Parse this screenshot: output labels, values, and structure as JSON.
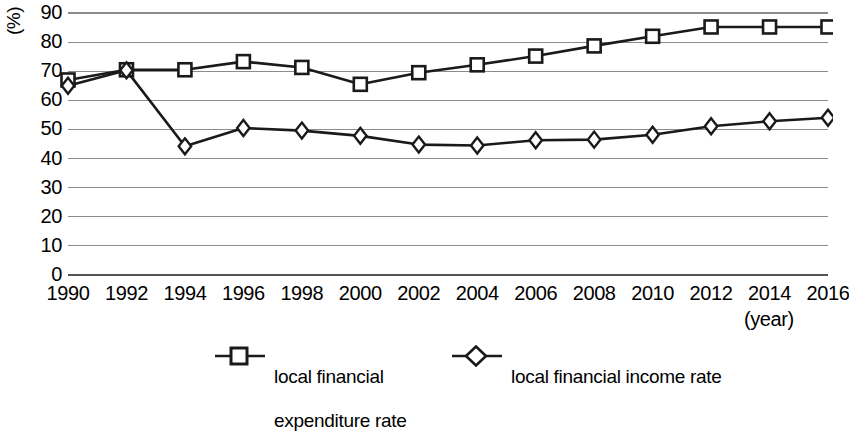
{
  "chart_data": {
    "type": "line",
    "title": "",
    "subtitle": "",
    "xlabel": "(year)",
    "ylabel": "(%)",
    "x": [
      1990,
      1992,
      1994,
      1996,
      1998,
      2000,
      2002,
      2004,
      2006,
      2008,
      2010,
      2012,
      2014,
      2016
    ],
    "categories": [
      "1990",
      "1992",
      "1994",
      "1996",
      "1998",
      "2000",
      "2002",
      "2004",
      "2006",
      "2008",
      "2010",
      "2012",
      "2014",
      "2016"
    ],
    "xlim": [
      1990,
      2016
    ],
    "ylim": [
      0,
      90
    ],
    "y_ticks": [
      0,
      10,
      20,
      30,
      40,
      50,
      60,
      70,
      80,
      90
    ],
    "y_tick_labels": [
      "0",
      "10",
      "20",
      "30",
      "40",
      "50",
      "60",
      "70",
      "80",
      "90"
    ],
    "grid": true,
    "grid_axis": "y",
    "legend_position": "bottom",
    "series": [
      {
        "name": "local financial expenditure rate",
        "name_lines": [
          "local financial",
          "expenditure rate"
        ],
        "marker": "square",
        "color": "#1a1a1a",
        "values": [
          67,
          70.5,
          70.5,
          73.3,
          71.3,
          65.5,
          69.5,
          72.2,
          75.2,
          78.7,
          82,
          85.2,
          85.2,
          85.2
        ]
      },
      {
        "name": "local financial income rate",
        "name_lines": [
          "local financial income rate"
        ],
        "marker": "diamond",
        "color": "#1a1a1a",
        "values": [
          65,
          70.3,
          44.2,
          50.5,
          49.6,
          47.8,
          44.8,
          44.5,
          46.3,
          46.5,
          48.2,
          51.1,
          52.8,
          54
        ]
      }
    ]
  },
  "axes": {
    "y_unit": "(%)",
    "x_unit": "(year)"
  },
  "legend": {
    "items": [
      {
        "marker": "square-marker-icon",
        "label_line1": "local financial",
        "label_line2": "expenditure rate"
      },
      {
        "marker": "diamond-marker-icon",
        "label_line1": "local financial income rate",
        "label_line2": ""
      }
    ]
  },
  "style": {
    "grid_color": "#8c8c8c",
    "axis_color": "#555555",
    "series_color": "#1a1a1a",
    "background": "#ffffff"
  }
}
